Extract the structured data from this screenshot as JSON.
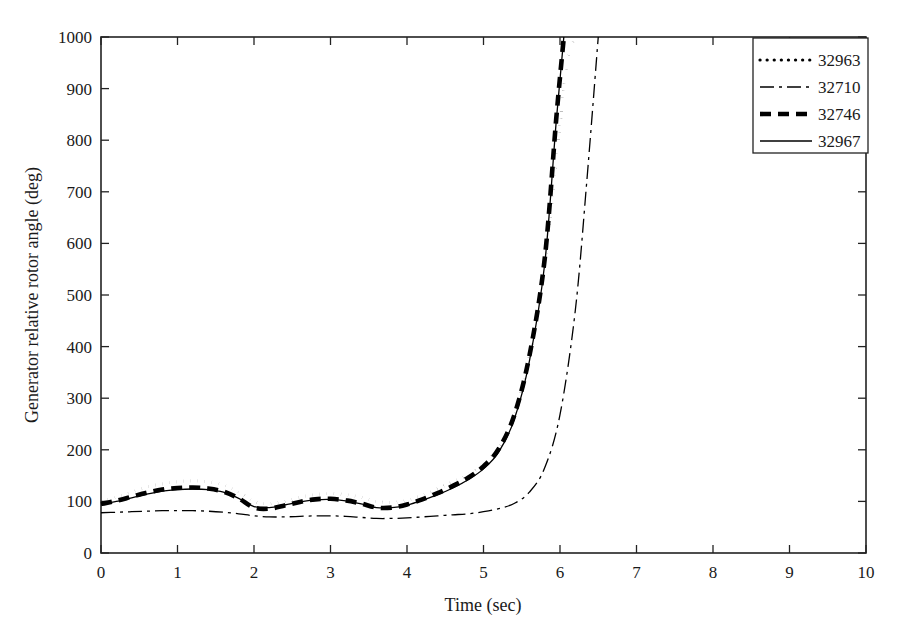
{
  "chart_data": {
    "type": "line",
    "title": "",
    "xlabel": "Time (sec)",
    "ylabel": "Generator relative rotor angle (deg)",
    "xlim": [
      0,
      10
    ],
    "ylim": [
      0,
      1000
    ],
    "xticks": [
      "0",
      "1",
      "2",
      "3",
      "4",
      "5",
      "6",
      "7",
      "8",
      "9",
      "10"
    ],
    "yticks": [
      "0",
      "100",
      "200",
      "300",
      "400",
      "500",
      "600",
      "700",
      "800",
      "900",
      "1000"
    ],
    "grid": false,
    "legend_position": "top-right",
    "background": "#ffffff",
    "axis_color": "#222222",
    "series": [
      {
        "name": "32963",
        "style": "dotted",
        "color": "#000000",
        "width": 3.2,
        "dasharray": "0.1,7",
        "x": [
          0.0,
          0.2,
          0.4,
          0.6,
          0.8,
          1.0,
          1.2,
          1.4,
          1.6,
          1.8,
          2.0,
          2.2,
          2.4,
          2.6,
          2.8,
          3.0,
          3.2,
          3.4,
          3.6,
          3.8,
          4.0,
          4.2,
          4.4,
          4.6,
          4.8,
          5.0,
          5.2,
          5.4,
          5.6,
          5.8,
          6.0,
          6.1,
          6.2
        ],
        "y": [
          100,
          108,
          118,
          128,
          134,
          138,
          140,
          138,
          132,
          118,
          100,
          96,
          100,
          108,
          113,
          115,
          113,
          108,
          100,
          98,
          102,
          112,
          124,
          138,
          152,
          172,
          205,
          268,
          380,
          560,
          830,
          960,
          1000
        ]
      },
      {
        "name": "32710",
        "style": "dash-dot-thin",
        "color": "#000000",
        "width": 1.3,
        "dasharray": "14,5,3,5",
        "x": [
          0.0,
          0.2,
          0.4,
          0.6,
          0.8,
          1.0,
          1.2,
          1.4,
          1.6,
          1.8,
          2.0,
          2.2,
          2.4,
          2.6,
          2.8,
          3.0,
          3.2,
          3.4,
          3.6,
          3.8,
          4.0,
          4.2,
          4.4,
          4.6,
          4.8,
          5.0,
          5.2,
          5.4,
          5.6,
          5.8,
          6.0,
          6.2,
          6.35,
          6.5
        ],
        "y": [
          78,
          79,
          80,
          81,
          82,
          82,
          82,
          81,
          79,
          76,
          72,
          70,
          70,
          71,
          72,
          72,
          71,
          69,
          67,
          67,
          68,
          70,
          72,
          74,
          76,
          80,
          86,
          96,
          118,
          165,
          268,
          470,
          720,
          1000
        ]
      },
      {
        "name": "32746",
        "style": "dashed-thick",
        "color": "#000000",
        "width": 4.6,
        "dasharray": "11,7",
        "x": [
          0.0,
          0.2,
          0.4,
          0.6,
          0.8,
          1.0,
          1.2,
          1.4,
          1.6,
          1.8,
          2.0,
          2.2,
          2.4,
          2.6,
          2.8,
          3.0,
          3.2,
          3.4,
          3.6,
          3.8,
          4.0,
          4.2,
          4.4,
          4.6,
          4.8,
          5.0,
          5.2,
          5.4,
          5.6,
          5.8,
          5.95,
          6.05
        ],
        "y": [
          95,
          101,
          109,
          117,
          123,
          126,
          127,
          125,
          119,
          106,
          88,
          86,
          92,
          99,
          104,
          105,
          102,
          96,
          88,
          88,
          94,
          104,
          116,
          130,
          146,
          168,
          202,
          266,
          382,
          570,
          840,
          1000
        ]
      },
      {
        "name": "32967",
        "style": "solid-thin",
        "color": "#000000",
        "width": 1.3,
        "dasharray": "none",
        "x": [
          0.0,
          0.2,
          0.4,
          0.6,
          0.8,
          1.0,
          1.2,
          1.4,
          1.6,
          1.8,
          2.0,
          2.2,
          2.4,
          2.6,
          2.8,
          3.0,
          3.2,
          3.4,
          3.6,
          3.8,
          4.0,
          4.2,
          4.4,
          4.6,
          4.8,
          5.0,
          5.2,
          5.4,
          5.6,
          5.8,
          5.95,
          6.05
        ],
        "y": [
          95,
          100,
          107,
          114,
          120,
          123,
          124,
          123,
          118,
          106,
          90,
          88,
          93,
          99,
          103,
          104,
          101,
          95,
          88,
          88,
          93,
          102,
          113,
          126,
          142,
          163,
          196,
          258,
          372,
          560,
          835,
          1000
        ]
      }
    ]
  },
  "legend": {
    "items": [
      {
        "label": "32963"
      },
      {
        "label": "32710"
      },
      {
        "label": "32746"
      },
      {
        "label": "32967"
      }
    ]
  }
}
